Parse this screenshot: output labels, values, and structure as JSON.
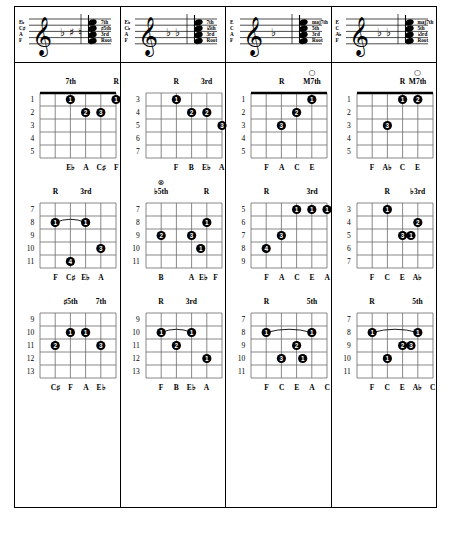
{
  "document": {
    "title": "Guitar Chord Voicings Chart",
    "columns": [
      {
        "id": "col-1",
        "staff": {
          "note_labels": [
            "E♭",
            "C♯",
            "A",
            "F"
          ],
          "interval_labels": [
            "7th",
            "♯5th",
            "3rd",
            "Root"
          ],
          "accidentals": [
            "♭",
            "♯",
            "♮"
          ]
        },
        "diagrams": [
          {
            "id": "c1-d1",
            "fret_numbers": [
              "1",
              "2",
              "3",
              "4",
              "5"
            ],
            "top_labels": [
              {
                "text": "7th",
                "string": 2
              },
              {
                "text": "R",
                "string": 5
              }
            ],
            "open_markers": [],
            "dots": [
              {
                "string": 2,
                "fret": 1,
                "finger": "1"
              },
              {
                "string": 5,
                "fret": 1,
                "finger": "1"
              },
              {
                "string": 3,
                "fret": 2,
                "finger": "2"
              },
              {
                "string": 4,
                "fret": 2,
                "finger": "3"
              }
            ],
            "barre": null,
            "note_names": [
              "E♭",
              "A",
              "C♯",
              "F"
            ],
            "note_strings": [
              2,
              3,
              4,
              5
            ]
          },
          {
            "id": "c1-d2",
            "fret_numbers": [
              "7",
              "8",
              "9",
              "10",
              "11"
            ],
            "top_labels": [
              {
                "text": "R",
                "string": 1
              },
              {
                "text": "3rd",
                "string": 3
              }
            ],
            "open_markers": [],
            "dots": [
              {
                "string": 1,
                "fret": 2,
                "finger": "1"
              },
              {
                "string": 3,
                "fret": 2,
                "finger": "1"
              },
              {
                "string": 4,
                "fret": 4,
                "finger": "3"
              },
              {
                "string": 2,
                "fret": 5,
                "finger": "4"
              }
            ],
            "barre": {
              "fret": 2,
              "from": 1,
              "to": 3
            },
            "note_names": [
              "F",
              "C♯",
              "E♭",
              "A"
            ],
            "note_strings": [
              1,
              2,
              3,
              4
            ]
          },
          {
            "id": "c1-d3",
            "fret_numbers": [
              "9",
              "10",
              "11",
              "12",
              "13"
            ],
            "top_labels": [
              {
                "text": "♯5th",
                "string": 2
              },
              {
                "text": "7th",
                "string": 4
              }
            ],
            "open_markers": [],
            "dots": [
              {
                "string": 2,
                "fret": 2,
                "finger": "1"
              },
              {
                "string": 3,
                "fret": 2,
                "finger": "1"
              },
              {
                "string": 1,
                "fret": 3,
                "finger": "2"
              },
              {
                "string": 4,
                "fret": 3,
                "finger": "3"
              }
            ],
            "barre": null,
            "note_names": [
              "C♯",
              "F",
              "A",
              "E♭"
            ],
            "note_strings": [
              1,
              2,
              3,
              4
            ]
          }
        ]
      },
      {
        "id": "col-2",
        "staff": {
          "note_labels": [
            "E♭",
            "C♭",
            "A",
            "F"
          ],
          "interval_labels": [
            "7th",
            "♭5th",
            "3rd",
            "Root"
          ],
          "accidentals": [
            "♭",
            "♭"
          ]
        },
        "diagrams": [
          {
            "id": "c2-d1",
            "fret_numbers": [
              "3",
              "4",
              "5",
              "6",
              "7"
            ],
            "top_labels": [
              {
                "text": "R",
                "string": 2
              },
              {
                "text": "3rd",
                "string": 4
              }
            ],
            "open_markers": [],
            "dots": [
              {
                "string": 2,
                "fret": 1,
                "finger": "1"
              },
              {
                "string": 3,
                "fret": 2,
                "finger": "2"
              },
              {
                "string": 4,
                "fret": 2,
                "finger": "2"
              },
              {
                "string": 5,
                "fret": 3,
                "finger": "3"
              }
            ],
            "barre": null,
            "note_names": [
              "F",
              "B",
              "E♭",
              "A"
            ],
            "note_strings": [
              2,
              3,
              4,
              5
            ]
          },
          {
            "id": "c2-d2",
            "fret_numbers": [
              "7",
              "8",
              "9",
              "10",
              "11"
            ],
            "top_labels": [
              {
                "text": "♭5th",
                "string": 1
              },
              {
                "text": "R",
                "string": 4
              }
            ],
            "open_markers": [
              {
                "string": 1,
                "symbol": "⊗"
              }
            ],
            "dots": [
              {
                "string": 4,
                "fret": 2,
                "finger": "1"
              },
              {
                "string": 1,
                "fret": 3,
                "finger": "2"
              },
              {
                "string": 3,
                "fret": 3,
                "finger": "3"
              },
              {
                "string": 3.6,
                "fret": 4,
                "finger": "1"
              }
            ],
            "barre": null,
            "note_names": [
              "B",
              "A",
              "E♭",
              "F"
            ],
            "note_strings": [
              1,
              3,
              3.8,
              4.6
            ]
          },
          {
            "id": "c2-d3",
            "fret_numbers": [
              "9",
              "10",
              "11",
              "12",
              "13"
            ],
            "top_labels": [
              {
                "text": "R",
                "string": 1
              },
              {
                "text": "3rd",
                "string": 3
              }
            ],
            "open_markers": [],
            "dots": [
              {
                "string": 1,
                "fret": 2,
                "finger": "1"
              },
              {
                "string": 3,
                "fret": 2,
                "finger": "1"
              },
              {
                "string": 2,
                "fret": 3,
                "finger": "2"
              },
              {
                "string": 4,
                "fret": 4,
                "finger": "1"
              }
            ],
            "barre": {
              "fret": 2,
              "from": 1,
              "to": 3
            },
            "note_names": [
              "F",
              "B",
              "E♭",
              "A"
            ],
            "note_strings": [
              1,
              2,
              3,
              4
            ]
          }
        ]
      },
      {
        "id": "col-3",
        "staff": {
          "note_labels": [
            "E",
            "C",
            "A",
            "F"
          ],
          "interval_labels": [
            "maj7th",
            "5th",
            "3rd",
            "Root"
          ],
          "accidentals": [
            "♭"
          ]
        },
        "diagrams": [
          {
            "id": "c3-d1",
            "fret_numbers": [
              "1",
              "2",
              "3",
              "4",
              "5"
            ],
            "top_labels": [
              {
                "text": "R",
                "string": 2
              },
              {
                "text": "M7th",
                "string": 4
              }
            ],
            "open_markers": [
              {
                "string": 4,
                "symbol": "○"
              }
            ],
            "dots": [
              {
                "string": 4,
                "fret": 1,
                "finger": "1"
              },
              {
                "string": 3,
                "fret": 2,
                "finger": "2"
              },
              {
                "string": 2,
                "fret": 3,
                "finger": "3"
              }
            ],
            "barre": null,
            "note_names": [
              "F",
              "A",
              "C",
              "E"
            ],
            "note_strings": [
              1,
              2,
              3,
              4
            ]
          },
          {
            "id": "c3-d2",
            "fret_numbers": [
              "5",
              "6",
              "7",
              "8",
              "9"
            ],
            "top_labels": [
              {
                "text": "R",
                "string": 1
              },
              {
                "text": "3rd",
                "string": 4
              }
            ],
            "open_markers": [],
            "dots": [
              {
                "string": 3,
                "fret": 1,
                "finger": "1"
              },
              {
                "string": 4,
                "fret": 1,
                "finger": "1"
              },
              {
                "string": 5,
                "fret": 1,
                "finger": "1"
              },
              {
                "string": 2,
                "fret": 3,
                "finger": "3"
              },
              {
                "string": 1,
                "fret": 4,
                "finger": "4"
              }
            ],
            "barre": null,
            "note_names": [
              "F",
              "A",
              "C",
              "E",
              "A"
            ],
            "note_strings": [
              1,
              2,
              3,
              4,
              5
            ]
          },
          {
            "id": "c3-d3",
            "fret_numbers": [
              "7",
              "8",
              "9",
              "10",
              "11"
            ],
            "top_labels": [
              {
                "text": "R",
                "string": 1
              },
              {
                "text": "5th",
                "string": 4
              }
            ],
            "open_markers": [],
            "dots": [
              {
                "string": 1,
                "fret": 2,
                "finger": "1"
              },
              {
                "string": 4,
                "fret": 2,
                "finger": "1"
              },
              {
                "string": 3,
                "fret": 3,
                "finger": "2"
              },
              {
                "string": 2,
                "fret": 4,
                "finger": "3"
              },
              {
                "string": 3.4,
                "fret": 4,
                "finger": "1"
              }
            ],
            "barre": {
              "fret": 2,
              "from": 1,
              "to": 4
            },
            "note_names": [
              "F",
              "C",
              "E",
              "A",
              "C"
            ],
            "note_strings": [
              1,
              2,
              3,
              4,
              5
            ]
          }
        ]
      },
      {
        "id": "col-4",
        "staff": {
          "note_labels": [
            "E",
            "C",
            "A♭",
            "F"
          ],
          "interval_labels": [
            "maj7th",
            "5th",
            "♭3rd",
            "Root"
          ],
          "accidentals": [
            "♭",
            "♭"
          ]
        },
        "diagrams": [
          {
            "id": "c4-d1",
            "fret_numbers": [
              "1",
              "2",
              "3",
              "4",
              "5"
            ],
            "top_labels": [
              {
                "text": "R",
                "string": 3
              },
              {
                "text": "M7th",
                "string": 4
              }
            ],
            "open_markers": [
              {
                "string": 4,
                "symbol": "○"
              }
            ],
            "dots": [
              {
                "string": 3,
                "fret": 1,
                "finger": "1"
              },
              {
                "string": 4,
                "fret": 1,
                "finger": "2"
              },
              {
                "string": 2,
                "fret": 3,
                "finger": "3"
              }
            ],
            "barre": null,
            "note_names": [
              "F",
              "A♭",
              "C",
              "E"
            ],
            "note_strings": [
              1,
              2,
              3,
              4
            ]
          },
          {
            "id": "c4-d2",
            "fret_numbers": [
              "3",
              "4",
              "5",
              "6",
              "7"
            ],
            "top_labels": [
              {
                "text": "R",
                "string": 2
              },
              {
                "text": "♭3rd",
                "string": 4
              }
            ],
            "open_markers": [],
            "dots": [
              {
                "string": 2,
                "fret": 1,
                "finger": "1"
              },
              {
                "string": 4,
                "fret": 2,
                "finger": "2"
              },
              {
                "string": 3,
                "fret": 3,
                "finger": "3"
              },
              {
                "string": 3.55,
                "fret": 3,
                "finger": "1"
              }
            ],
            "barre": null,
            "note_names": [
              "F",
              "C",
              "E",
              "A♭"
            ],
            "note_strings": [
              1,
              2,
              3,
              4
            ]
          },
          {
            "id": "c4-d3",
            "fret_numbers": [
              "7",
              "8",
              "9",
              "10",
              "11"
            ],
            "top_labels": [
              {
                "text": "R",
                "string": 1
              },
              {
                "text": "5th",
                "string": 4
              }
            ],
            "open_markers": [],
            "dots": [
              {
                "string": 1,
                "fret": 2,
                "finger": "1"
              },
              {
                "string": 4,
                "fret": 2,
                "finger": "1"
              },
              {
                "string": 3,
                "fret": 3,
                "finger": "2"
              },
              {
                "string": 3.55,
                "fret": 3,
                "finger": "3"
              },
              {
                "string": 2,
                "fret": 4,
                "finger": "1"
              }
            ],
            "barre": {
              "fret": 2,
              "from": 1,
              "to": 4
            },
            "note_names": [
              "F",
              "C",
              "E",
              "A♭",
              "C"
            ],
            "note_strings": [
              1,
              2,
              3,
              4,
              5
            ]
          }
        ]
      }
    ]
  },
  "colors": {
    "ink": "#000000",
    "paper": "#ffffff",
    "grid_line": "#6b6b6b",
    "nut": "#000000"
  }
}
